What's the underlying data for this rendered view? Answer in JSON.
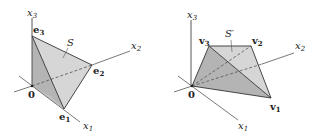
{
  "figure_left": {
    "axes": {
      "x1": "x",
      "x1_sub": "1",
      "x2": "x",
      "x2_sub": "2",
      "x3": "x",
      "x3_sub": "3"
    },
    "origin": "0",
    "vertices": [
      {
        "name": "e",
        "sub": "1"
      },
      {
        "name": "e",
        "sub": "2"
      },
      {
        "name": "e",
        "sub": "3"
      }
    ],
    "region_label": "S",
    "colors": {
      "face_light": "#d6d6d6",
      "face_dark": "#b8b8b8",
      "edge": "#333333",
      "axis": "#555555"
    }
  },
  "figure_right": {
    "axes": {
      "x1": "x",
      "x1_sub": "1",
      "x2": "x",
      "x2_sub": "2",
      "x3": "x",
      "x3_sub": "3"
    },
    "origin": "0",
    "vertices": [
      {
        "name": "v",
        "sub": "1"
      },
      {
        "name": "v",
        "sub": "2"
      },
      {
        "name": "v",
        "sub": "3"
      }
    ],
    "region_label": "S′",
    "colors": {
      "face_light": "#d6d6d6",
      "face_dark": "#b8b8b8",
      "edge": "#333333",
      "axis": "#555555"
    }
  }
}
